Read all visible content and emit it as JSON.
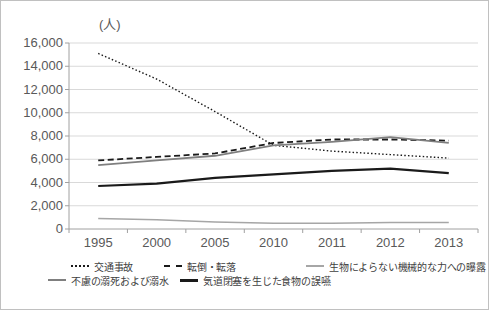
{
  "chart_data": {
    "type": "line",
    "title": "",
    "ylabel": "(人)",
    "xlabel": "",
    "ylim": [
      0,
      16000
    ],
    "ytick_step": 2000,
    "ytick_labels": [
      "0",
      "2,000",
      "4,000",
      "6,000",
      "8,000",
      "10,000",
      "12,000",
      "14,000",
      "16,000"
    ],
    "grid": true,
    "legend_position": "bottom",
    "categories": [
      "1995",
      "2000",
      "2005",
      "2010",
      "2011",
      "2012",
      "2013"
    ],
    "series": [
      {
        "name": "交通事故",
        "style": "dotted",
        "color": "#1a1a1a",
        "thickness": 1.4,
        "values": [
          15100,
          12900,
          10100,
          7200,
          6700,
          6400,
          6100
        ]
      },
      {
        "name": "転倒・転落",
        "style": "dashed",
        "color": "#1a1a1a",
        "thickness": 1.8,
        "values": [
          5900,
          6200,
          6500,
          7400,
          7700,
          7700,
          7600
        ]
      },
      {
        "name": "生物によらない機械的な力への曝露",
        "style": "solid",
        "color": "#a6a6a6",
        "thickness": 1.5,
        "values": [
          900,
          800,
          600,
          500,
          500,
          550,
          550
        ]
      },
      {
        "name": "不慮の溺死および溺水",
        "style": "solid",
        "color": "#7f7f7f",
        "thickness": 1.8,
        "values": [
          5500,
          5900,
          6300,
          7200,
          7500,
          7900,
          7400
        ]
      },
      {
        "name": "気道閉塞を生じた食物の誤嚥",
        "style": "solid",
        "color": "#1a1a1a",
        "thickness": 2.2,
        "values": [
          3700,
          3900,
          4400,
          4700,
          5000,
          5200,
          4800
        ]
      }
    ],
    "colors": {
      "gridline": "#d9d9d9",
      "axis": "#a0a0a0",
      "tick_text": "#595959"
    }
  }
}
